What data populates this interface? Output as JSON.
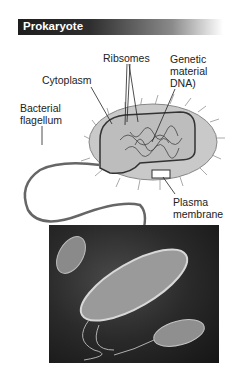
{
  "header": {
    "title": "Prokaryote"
  },
  "labels": {
    "ribosomes": "Ribsomes",
    "genetic_material_1": "Genetic",
    "genetic_material_2": "material",
    "genetic_material_3": "DNA)",
    "cytoplasm": "Cytoplasm",
    "flagellum_1": "Bacterial",
    "flagellum_2": "flagellum",
    "plasma_1": "Plasma",
    "plasma_2": "membrane"
  },
  "colors": {
    "header_dark": "#1e1e1e",
    "header_text": "#ffffff",
    "label_text": "#222222"
  }
}
